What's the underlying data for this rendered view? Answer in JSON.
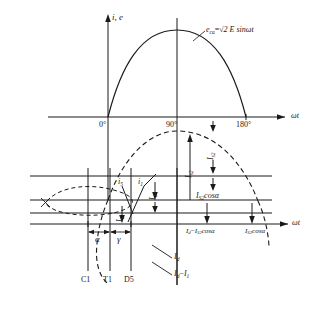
{
  "figure": {
    "type": "waveform-diagram",
    "domain": "power-electronics-thyristor-commutation",
    "background": "#ffffff",
    "stroke": "#1a1a1a"
  },
  "axes": {
    "top": {
      "vertical_label": "i, e",
      "horizontal_label": "ωt",
      "ticks": [
        "0°",
        "90°",
        "180°"
      ]
    },
    "bottom": {
      "horizontal_label": "ωt"
    }
  },
  "curves": {
    "sine_solid": {
      "label_prefix": "e",
      "label_sub": "ca",
      "label_eq": "=",
      "label_rhs": "√2 E sinωt",
      "style": "solid"
    },
    "sine_dashed": {
      "style": "dashed"
    },
    "loop_dashed": {
      "style": "dashed"
    }
  },
  "annotations": {
    "i5": {
      "text": "i",
      "sub": "5"
    },
    "i1": {
      "text": "i",
      "sub": "1"
    },
    "alpha": "α",
    "gamma": "γ",
    "Id_vert": {
      "text": "I",
      "sub": "d"
    },
    "Is2_vert": {
      "text": "I",
      "sub": "s2"
    },
    "Is2_cos_a": {
      "text": "I",
      "sub": "S2",
      "rest": "cosα"
    },
    "Id_minus_Is2_cos_a": {
      "lhs": "I",
      "lhs_sub": "d",
      "minus": "−",
      "rhs": "I",
      "rhs_sub": "S2",
      "rest": "cosα"
    },
    "Is2_cos_a_right": {
      "text": "I",
      "sub": "S2",
      "rest": "cosα"
    },
    "Id_leader": {
      "text": "I",
      "sub": "d"
    },
    "Id_minus_I1_leader": {
      "text": "I",
      "sub": "d",
      "minus": "−",
      "text2": "I",
      "sub2": "1"
    }
  },
  "device_labels": [
    {
      "name": "C1"
    },
    {
      "name": "T1"
    },
    {
      "name": "D5"
    }
  ]
}
